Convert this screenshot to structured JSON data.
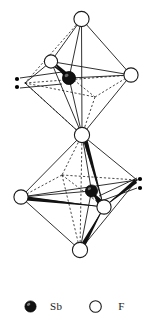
{
  "figure": {
    "background_color": "#ffffff",
    "line_color": "#1a1a1a",
    "atom_fill_open": "#ffffff",
    "atom_fill_filled": "#141414",
    "lone_pair_color": "#000000"
  },
  "legend": {
    "items": [
      {
        "symbol": "Sb",
        "marker": "filled-circle",
        "color": "#141414"
      },
      {
        "symbol": "F",
        "marker": "open-circle",
        "color": "#ffffff"
      }
    ],
    "sb_label": "Sb",
    "f_label": "F"
  },
  "structure": {
    "description": "Two corner-sharing octahedra, each with a central Sb atom and a stereochemically active lone pair shown as two dots",
    "units": [
      {
        "id": "upper-octahedron",
        "center_atom": {
          "element": "Sb",
          "cx": 69,
          "cy": 78,
          "r": 6.5
        },
        "lone_pair": {
          "dots": [
            {
              "cx": 17,
              "cy": 79
            },
            {
              "cx": 17,
              "cy": 87
            }
          ]
        },
        "vertices": [
          {
            "element": "F",
            "label": "apex-top",
            "cx": 81.5,
            "cy": 19,
            "r": 7.5,
            "visible": true
          },
          {
            "element": "F",
            "label": "back-upper-left",
            "cx": 51,
            "cy": 61.5,
            "r": 6.5,
            "visible": true
          },
          {
            "element": "F",
            "label": "right",
            "cx": 131,
            "cy": 75,
            "r": 7.0,
            "visible": true
          },
          {
            "element": "F",
            "label": "left-hidden",
            "cx": 25,
            "cy": 83,
            "r": 0,
            "visible": false
          },
          {
            "element": "F",
            "label": "front-hidden",
            "cx": 95,
            "cy": 97,
            "r": 0,
            "visible": false
          },
          {
            "element": "F",
            "label": "shared-bridge",
            "cx": 82,
            "cy": 135,
            "r": 7.5,
            "visible": true
          }
        ]
      },
      {
        "id": "lower-octahedron",
        "center_atom": {
          "element": "Sb",
          "cx": 91.5,
          "cy": 191,
          "r": 6.0
        },
        "lone_pair": {
          "dots": [
            {
              "cx": 140,
              "cy": 179
            },
            {
              "cx": 140,
              "cy": 188
            }
          ]
        },
        "vertices": [
          {
            "element": "F",
            "label": "apex-top-shared",
            "cx": 82,
            "cy": 135,
            "r": 7.5,
            "visible": true
          },
          {
            "element": "F",
            "label": "left",
            "cx": 21,
            "cy": 197,
            "r": 7.0,
            "visible": true
          },
          {
            "element": "F",
            "label": "front-right",
            "cx": 104,
            "cy": 207,
            "r": 7.0,
            "visible": true
          },
          {
            "element": "F",
            "label": "right-hidden",
            "cx": 137,
            "cy": 180,
            "r": 0,
            "visible": false
          },
          {
            "element": "F",
            "label": "back-hidden",
            "cx": 62,
            "cy": 175,
            "r": 0,
            "visible": false
          },
          {
            "element": "F",
            "label": "apex-bottom",
            "cx": 80,
            "cy": 250,
            "r": 7.5,
            "visible": true
          }
        ]
      }
    ]
  }
}
